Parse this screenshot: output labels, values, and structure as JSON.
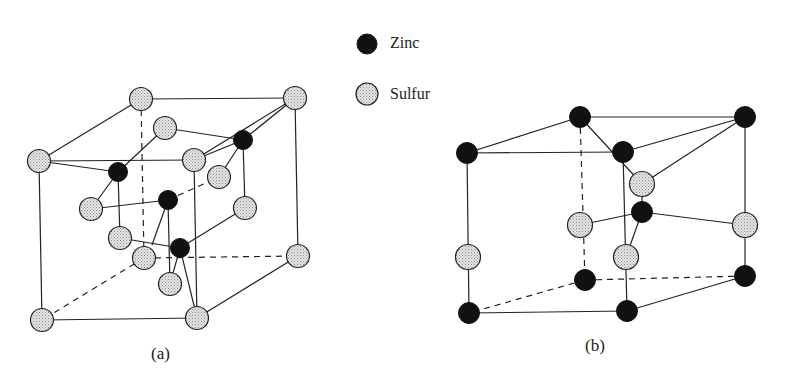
{
  "legend": {
    "zinc_label": "Zinc",
    "sulfur_label": "Sulfur",
    "zinc_color": "#111111",
    "sulfur_color": "#d4d4d4"
  },
  "figure_a": {
    "caption": "(a)",
    "description": "Zinc blende (cubic ZnS) unit cell"
  },
  "figure_b": {
    "caption": "(b)",
    "description": "Wurtzite (hexagonal ZnS) structure"
  }
}
